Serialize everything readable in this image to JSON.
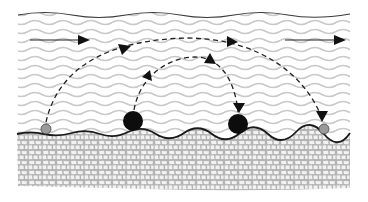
{
  "diagram": {
    "colors": {
      "background": "#ffffff",
      "water_wave": "#c8c8c8",
      "surface_line": "#3a3a3a",
      "bed_line": "#1a1a1a",
      "sediment_fill": "#b4b4b4",
      "sediment_grain": "#f2f2f2",
      "large_particle": "#0d0d0d",
      "small_particle": "#9a9a9a",
      "arrow": "#111111"
    },
    "regions": [
      {
        "name": "water-column",
        "label": "Water"
      },
      {
        "name": "sediment-bed",
        "label": "Sediment bed"
      }
    ],
    "flow_arrows": [
      {
        "name": "flow-arrow-left",
        "direction": "right",
        "x1": 30,
        "x2": 88,
        "y": 40
      },
      {
        "name": "flow-arrow-right",
        "direction": "right",
        "x1": 285,
        "x2": 345,
        "y": 40
      }
    ],
    "particles": [
      {
        "name": "small-particle-start",
        "type": "small",
        "cx": 46,
        "cy": 129,
        "r": 5
      },
      {
        "name": "large-particle-start",
        "type": "large",
        "cx": 133,
        "cy": 121,
        "r": 10
      },
      {
        "name": "large-particle-end",
        "type": "large",
        "cx": 238,
        "cy": 124,
        "r": 10
      },
      {
        "name": "small-particle-end",
        "type": "small",
        "cx": 324,
        "cy": 129,
        "r": 5
      }
    ],
    "trajectories": [
      {
        "name": "small-particle-trajectory",
        "label": "Long saltation hop (small particle)",
        "from": "small-particle-start",
        "to": "small-particle-end"
      },
      {
        "name": "large-particle-trajectory",
        "label": "Short saltation hop (large particle)",
        "from": "large-particle-start",
        "to": "large-particle-end"
      }
    ]
  }
}
